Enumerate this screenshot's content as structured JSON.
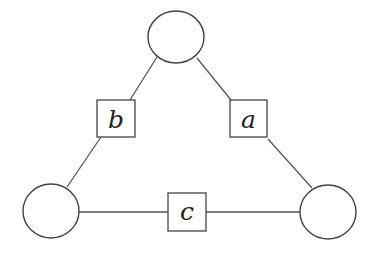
{
  "diagram": {
    "type": "triangle-graph",
    "nodes": [
      {
        "id": "top",
        "cx": 176,
        "cy": 37,
        "rx": 28,
        "ry": 26
      },
      {
        "id": "bottom-left",
        "cx": 51,
        "cy": 211,
        "rx": 28,
        "ry": 27
      },
      {
        "id": "bottom-right",
        "cx": 328,
        "cy": 212,
        "rx": 28,
        "ry": 27
      }
    ],
    "edges": [
      {
        "id": "edge-b",
        "from": "top",
        "to": "bottom-left",
        "label": "b"
      },
      {
        "id": "edge-a",
        "from": "top",
        "to": "bottom-right",
        "label": "a"
      },
      {
        "id": "edge-c",
        "from": "bottom-left",
        "to": "bottom-right",
        "label": "c"
      }
    ],
    "labels": {
      "a": "a",
      "b": "b",
      "c": "c"
    },
    "colors": {
      "line": "#555555",
      "text": "#222222",
      "background": "#ffffff"
    }
  }
}
